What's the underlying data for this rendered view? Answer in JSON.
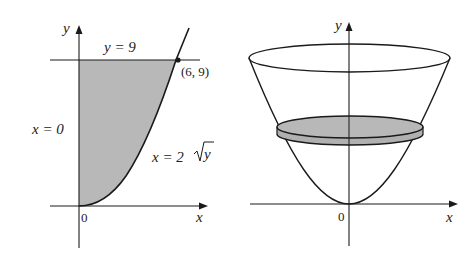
{
  "colors": {
    "ink": "#1a1a1a",
    "shade": "#b8b8b8",
    "background": "#ffffff"
  },
  "left_panel": {
    "axis_y_label": "y",
    "axis_x_label": "x",
    "origin_label": "0",
    "line_top_label": "y = 9",
    "line_left_label": "x = 0",
    "curve_label_prefix": "x = 2",
    "curve_label_radicand": "y",
    "point_label": "(6, 9)",
    "region_description": "region bounded by x = 0, y = 9, and x = 2√y"
  },
  "right_panel": {
    "axis_y_label": "y",
    "axis_x_label": "x",
    "origin_label": "0",
    "description": "paraboloid of revolution about the y-axis with a shaded disk cross-section"
  }
}
